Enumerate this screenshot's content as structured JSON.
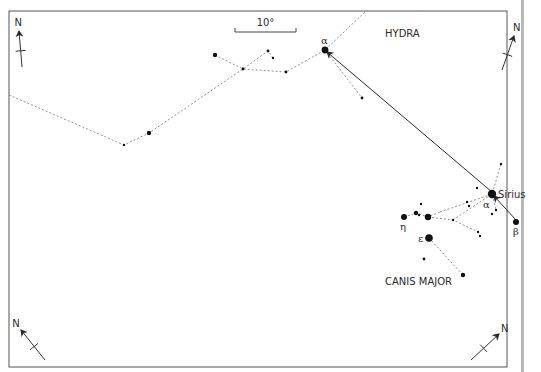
{
  "frame": {
    "x": 9,
    "y": 11,
    "w": 498,
    "h": 356,
    "stroke": "#555555",
    "side_strip": {
      "x": 521,
      "w": 3,
      "color": "#b8b8b8"
    }
  },
  "scale_bar": {
    "label": "10°",
    "x1": 235,
    "x2": 296,
    "y": 32
  },
  "constellations": [
    {
      "name": "HYDRA",
      "label_x": 385,
      "label_y": 34
    },
    {
      "name": "CANIS MAJOR",
      "label_x": 385,
      "label_y": 282
    }
  ],
  "star_labels": {
    "hydra_alpha": "α",
    "sirius": "Sirius",
    "cma_alpha": "α",
    "cma_beta": "β",
    "cma_eta": "η",
    "cma_epsilon": "ε"
  },
  "compass": {
    "label": "N"
  },
  "stars": [
    {
      "id": "hydra-alpha",
      "x": 325,
      "y": 50,
      "r": 3.4
    },
    {
      "id": "h1",
      "x": 215,
      "y": 55,
      "r": 2.2
    },
    {
      "id": "h2",
      "x": 243,
      "y": 69,
      "r": 1.4
    },
    {
      "id": "h3",
      "x": 268,
      "y": 51,
      "r": 1.4
    },
    {
      "id": "h4",
      "x": 273,
      "y": 58,
      "r": 1.2
    },
    {
      "id": "h5",
      "x": 286,
      "y": 72,
      "r": 1.4
    },
    {
      "id": "h6",
      "x": 149,
      "y": 133,
      "r": 2.2
    },
    {
      "id": "h7",
      "x": 124,
      "y": 145,
      "r": 1.2
    },
    {
      "id": "h8",
      "x": 362,
      "y": 98,
      "r": 1.4
    },
    {
      "id": "sirius",
      "x": 492,
      "y": 194,
      "r": 4.2
    },
    {
      "id": "cma-beta",
      "x": 516,
      "y": 222,
      "r": 3
    },
    {
      "id": "c1",
      "x": 501,
      "y": 164,
      "r": 1.2
    },
    {
      "id": "c2",
      "x": 477,
      "y": 188,
      "r": 1.2
    },
    {
      "id": "c3",
      "x": 496,
      "y": 210,
      "r": 1.2
    },
    {
      "id": "c4",
      "x": 492,
      "y": 214,
      "r": 1.2
    },
    {
      "id": "c5",
      "x": 467,
      "y": 202,
      "r": 1.2
    },
    {
      "id": "c6",
      "x": 469,
      "y": 206,
      "r": 1.2
    },
    {
      "id": "cma-eta",
      "x": 404,
      "y": 217,
      "r": 3
    },
    {
      "id": "c7",
      "x": 428,
      "y": 217,
      "r": 3.2
    },
    {
      "id": "c8",
      "x": 416,
      "y": 213,
      "r": 2.2
    },
    {
      "id": "c9",
      "x": 421,
      "y": 204,
      "r": 1.2
    },
    {
      "id": "c10",
      "x": 419,
      "y": 215,
      "r": 1.2
    },
    {
      "id": "c11",
      "x": 453,
      "y": 220,
      "r": 1.2
    },
    {
      "id": "c12",
      "x": 478,
      "y": 232,
      "r": 1.2
    },
    {
      "id": "c13",
      "x": 480,
      "y": 236,
      "r": 1.2
    },
    {
      "id": "cma-epsilon",
      "x": 429,
      "y": 238,
      "r": 3.8
    },
    {
      "id": "c14",
      "x": 424,
      "y": 259,
      "r": 1.4
    },
    {
      "id": "c15",
      "x": 463,
      "y": 275,
      "r": 2.2
    }
  ],
  "dashed_lines": [
    [
      [
        9,
        95
      ],
      [
        124,
        145
      ],
      [
        149,
        133
      ],
      [
        243,
        69
      ],
      [
        268,
        51
      ],
      [
        273,
        58
      ]
    ],
    [
      [
        215,
        55
      ],
      [
        243,
        69
      ],
      [
        286,
        72
      ],
      [
        325,
        50
      ],
      [
        366,
        11
      ]
    ],
    [
      [
        325,
        50
      ],
      [
        362,
        98
      ]
    ],
    [
      [
        404,
        217
      ],
      [
        416,
        213
      ],
      [
        428,
        217
      ],
      [
        440,
        212
      ]
    ],
    [
      [
        428,
        217
      ],
      [
        453,
        220
      ],
      [
        478,
        232
      ]
    ],
    [
      [
        429,
        238
      ],
      [
        463,
        275
      ]
    ],
    [
      [
        440,
        212
      ],
      [
        492,
        194
      ],
      [
        501,
        164
      ]
    ],
    [
      [
        453,
        220
      ],
      [
        492,
        194
      ],
      [
        496,
        210
      ]
    ]
  ],
  "arrows": [
    {
      "from": [
        492,
        192
      ],
      "to": [
        327,
        52
      ]
    },
    {
      "from": [
        516,
        220
      ],
      "to": [
        494,
        196
      ]
    }
  ],
  "compasses": [
    {
      "x": 22,
      "y": 67,
      "dx": -3,
      "dy": -36
    },
    {
      "x": 502,
      "y": 70,
      "dx": 12,
      "dy": -34
    },
    {
      "x": 45,
      "y": 360,
      "dx": -24,
      "dy": -30
    },
    {
      "x": 471,
      "y": 360,
      "dx": 28,
      "dy": -26
    }
  ]
}
